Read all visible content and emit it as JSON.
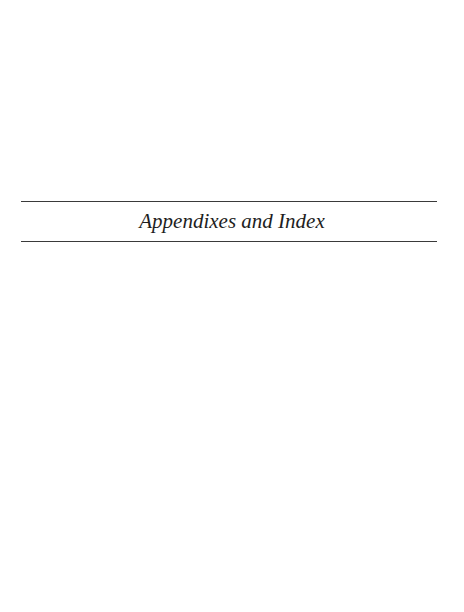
{
  "page": {
    "title": "Appendixes and Index"
  }
}
